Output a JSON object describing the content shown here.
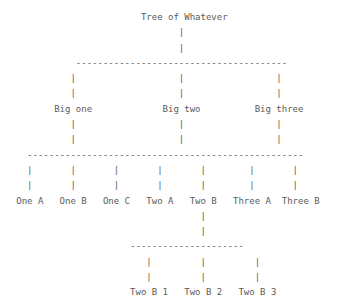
{
  "diagram": {
    "type": "ascii-tree",
    "title": "Tree of Whatever",
    "text_color": "#5a5a5a",
    "background": "#ffffff",
    "nodes": {
      "root": "Tree of Whatever",
      "level1": [
        "Big one",
        "Big two",
        "Big three"
      ],
      "level2": [
        "One A",
        "One B",
        "One C",
        "Two A",
        "Two B",
        "Three A",
        "Three B"
      ],
      "level3": [
        "Two B 1",
        "Two B 2",
        "Two B 3"
      ]
    },
    "lines": [
      "                          Tree of Whatever",
      "                                 |",
      "                                 |",
      "              ---------------------------------------",
      "             |                   |                 |",
      "             |                   |                 |",
      "          Big one             Big two          Big three",
      "             |                   |                 |",
      "             |                   |                 |",
      "     ---------------------------------------------------",
      "     |       |       |       |       |        |       |",
      "     |       |       |       |       |        |       |",
      "   One A   One B   One C   Two A   Two B   Three A  Three B",
      "                                     |",
      "                                     |",
      "                        ---------------------",
      "                           |         |         |",
      "                           |         |         |",
      "                        Two B 1   Two B 2   Two B 3"
    ]
  }
}
